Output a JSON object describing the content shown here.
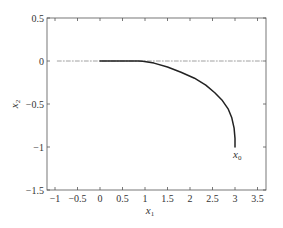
{
  "chart_data": {
    "type": "line",
    "title": "",
    "xlabel": "x1",
    "ylabel": "x2",
    "xlim": [
      -1.2,
      3.7
    ],
    "ylim": [
      -1.5,
      0.5
    ],
    "grid": false,
    "legend": null,
    "xticks": [
      -1,
      -0.5,
      0,
      0.5,
      1,
      1.5,
      2,
      2.5,
      3,
      3.5
    ],
    "xtick_labels": [
      "−1",
      "−0.5",
      "0",
      "0.5",
      "1",
      "1.5",
      "2",
      "2.5",
      "3",
      "3.5"
    ],
    "yticks": [
      0.5,
      0,
      -0.5,
      -1,
      -1.5
    ],
    "ytick_labels": [
      "0.5",
      "0",
      "−0.5",
      "−1",
      "−1.5"
    ],
    "series": [
      {
        "name": "trajectory",
        "style": "solid",
        "color": "#222222",
        "x": [
          3.0,
          3.0,
          2.98,
          2.93,
          2.85,
          2.72,
          2.55,
          2.35,
          2.1,
          1.8,
          1.5,
          1.2,
          0.95,
          0.85,
          0.5,
          0.0
        ],
        "y": [
          -1.0,
          -0.9,
          -0.78,
          -0.66,
          -0.56,
          -0.46,
          -0.37,
          -0.28,
          -0.2,
          -0.13,
          -0.07,
          -0.025,
          -0.003,
          0.0,
          0.0,
          0.0
        ]
      },
      {
        "name": "x2 = 0 reference",
        "style": "dash-dot",
        "color": "#888888",
        "x": [
          -0.95,
          3.65
        ],
        "y": [
          0,
          0
        ]
      }
    ],
    "annotations": [
      {
        "text": "x0",
        "x": 3.0,
        "y": -1.1
      }
    ]
  },
  "labels": {
    "xlabel_main": "x",
    "xlabel_sub": "1",
    "ylabel_main": "x",
    "ylabel_sub": "2",
    "annotation_main": "x",
    "annotation_sub": "0"
  }
}
